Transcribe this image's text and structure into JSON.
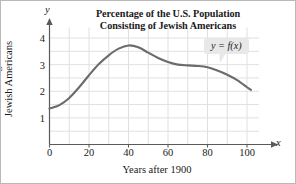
{
  "figure": {
    "title_line1": "Percentage of the U.S. Population",
    "title_line2": "Consisting of Jewish Americans",
    "callout_label": "y = f(x)",
    "axis_var_x": "x",
    "axis_var_y": "y",
    "xaxis_title": "Years after 1900",
    "yaxis_title_line1": "Percentage of",
    "yaxis_title_line2": "Jewish Americans"
  },
  "colors": {
    "curve": "#6b6b6b",
    "axis": "#5a5a5a",
    "grid": "#e0e0e0",
    "callout_background": "#e8e8e8",
    "text": "#1a1a1a",
    "frame": "#b9b9b9"
  },
  "chart_data": {
    "type": "line",
    "title": "Percentage of the U.S. Population Consisting of Jewish Americans",
    "xlabel": "Years after 1900",
    "ylabel": "Percentage of Jewish Americans",
    "annotation": "y = f(x)",
    "grid": true,
    "legend_position": "none",
    "xlim": [
      0,
      110
    ],
    "ylim": [
      0,
      4.4
    ],
    "xticks": [
      0,
      20,
      40,
      60,
      80,
      100
    ],
    "yticks": [
      1,
      2,
      3,
      4
    ],
    "xtick_labels": [
      "0",
      "20",
      "40",
      "60",
      "80",
      "100"
    ],
    "ytick_labels": [
      "1",
      "2",
      "3",
      "4"
    ],
    "x_minor_step": 10,
    "y_minor_step": 0.5,
    "series": [
      {
        "name": "y = f(x)",
        "x": [
          0,
          5,
          10,
          15,
          20,
          25,
          30,
          35,
          40,
          45,
          50,
          55,
          60,
          65,
          70,
          75,
          80,
          85,
          90,
          95,
          100,
          102
        ],
        "y": [
          1.35,
          1.48,
          1.75,
          2.15,
          2.6,
          3.02,
          3.35,
          3.6,
          3.72,
          3.65,
          3.45,
          3.25,
          3.1,
          3.0,
          2.97,
          2.95,
          2.9,
          2.78,
          2.62,
          2.42,
          2.15,
          2.05
        ]
      }
    ]
  }
}
